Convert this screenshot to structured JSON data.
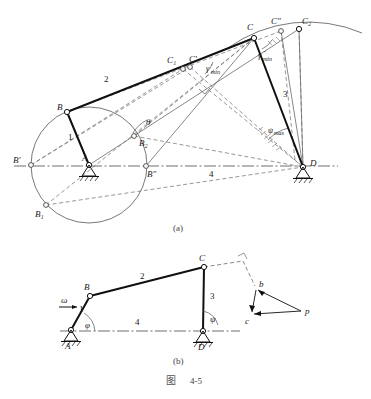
{
  "figure": {
    "caption_cn": "图",
    "caption_num": "4-5",
    "sub_a": "(a)",
    "sub_b": "(b)"
  },
  "colors": {
    "ink": "#1a1a1a",
    "thin": "#555555",
    "dash": "#6a6a6a",
    "centerline": "#4a4a4a",
    "background": "#ffffff"
  },
  "diagram_a": {
    "name": "four-bar-linkage-extreme-positions",
    "points": {
      "A": {
        "x": 89,
        "y": 165,
        "label": "A",
        "lx": 82,
        "ly": 161
      },
      "B": {
        "x": 67,
        "y": 112,
        "label": "B",
        "lx": 58,
        "ly": 110
      },
      "Bp": {
        "x": 31,
        "y": 165,
        "label": "B′",
        "lx": 14,
        "ly": 163
      },
      "Bpp": {
        "x": 146,
        "y": 166,
        "label": "B″",
        "lx": 148,
        "ly": 176
      },
      "B1": {
        "x": 46,
        "y": 205,
        "label": "B₁",
        "lx": 36,
        "ly": 216
      },
      "B2": {
        "x": 134,
        "y": 136,
        "label": "B₂",
        "lx": 138,
        "ly": 145
      },
      "C": {
        "x": 254,
        "y": 38,
        "label": "C",
        "lx": 248,
        "ly": 30
      },
      "C1": {
        "x": 183,
        "y": 69,
        "label": "C₁",
        "lx": 169,
        "ly": 63
      },
      "Cp": {
        "x": 190,
        "y": 67,
        "label": "C′",
        "lx": 191,
        "ly": 62
      },
      "Cpp": {
        "x": 281,
        "y": 31,
        "label": "C″",
        "lx": 273,
        "ly": 24
      },
      "C2": {
        "x": 299,
        "y": 29,
        "label": "C₂",
        "lx": 303,
        "ly": 24
      },
      "D": {
        "x": 303,
        "y": 167,
        "label": "D",
        "lx": 311,
        "ly": 165
      }
    },
    "link_labels": [
      {
        "name": "link-1",
        "text": "1",
        "x": 69,
        "y": 139
      },
      {
        "name": "link-2",
        "text": "2",
        "x": 106,
        "y": 81
      },
      {
        "name": "link-3",
        "text": "3",
        "x": 284,
        "y": 96
      },
      {
        "name": "link-4",
        "text": "4",
        "x": 211,
        "y": 176
      }
    ],
    "angles": [
      {
        "name": "theta",
        "text": "θ",
        "x": 148,
        "y": 124
      },
      {
        "name": "gamma-min-1",
        "text": "γ",
        "sub": "min",
        "prime": "′",
        "x": 209,
        "y": 70
      },
      {
        "name": "gamma-min-2",
        "text": "γ",
        "sub": "min",
        "prime": "″",
        "x": 261,
        "y": 57
      },
      {
        "name": "psi-max",
        "text": "ψ",
        "sub": "max",
        "x": 271,
        "y": 132
      }
    ]
  },
  "diagram_b": {
    "name": "velocity-analysis-linkage",
    "points": {
      "A": {
        "x": 71,
        "y": 330,
        "label": "A",
        "lx": 66,
        "ly": 347
      },
      "B": {
        "x": 90,
        "y": 296,
        "label": "B",
        "lx": 85,
        "ly": 288
      },
      "C": {
        "x": 204,
        "y": 267,
        "label": "C",
        "lx": 200,
        "ly": 260
      },
      "D": {
        "x": 203,
        "y": 331,
        "label": "D",
        "lx": 199,
        "ly": 348
      }
    },
    "link_labels": [
      {
        "name": "link-1",
        "text": "1",
        "x": 81,
        "y": 310
      },
      {
        "name": "link-2",
        "text": "2",
        "x": 142,
        "y": 277
      },
      {
        "name": "link-3",
        "text": "3",
        "x": 211,
        "y": 297
      },
      {
        "name": "link-4",
        "text": "4",
        "x": 137,
        "y": 323
      }
    ],
    "angles": [
      {
        "name": "omega",
        "text": "ω",
        "x": 64,
        "y": 301
      },
      {
        "name": "phi",
        "text": "φ",
        "x": 87,
        "y": 325
      },
      {
        "name": "psi",
        "text": "ψ",
        "x": 212,
        "y": 320
      }
    ],
    "velocity_polygon": {
      "name": "velocity-triangle",
      "vertices": {
        "b": {
          "x": 256,
          "y": 288,
          "label": "b",
          "lx": 259,
          "ly": 286
        },
        "c": {
          "x": 251,
          "y": 315,
          "label": "c",
          "lx": 246,
          "ly": 323
        },
        "p": {
          "x": 301,
          "y": 311,
          "label": "p",
          "lx": 305,
          "ly": 313
        }
      }
    }
  }
}
